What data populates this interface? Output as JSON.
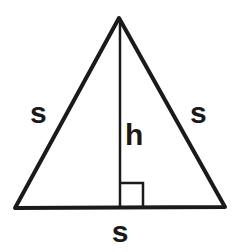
{
  "diagram": {
    "type": "equilateral-triangle-with-height",
    "labels": {
      "left_side": "s",
      "right_side": "s",
      "base": "s",
      "height": "h"
    },
    "colors": {
      "stroke": "#1a1a1a",
      "background": "#ffffff"
    },
    "right_angle_marker": true
  }
}
